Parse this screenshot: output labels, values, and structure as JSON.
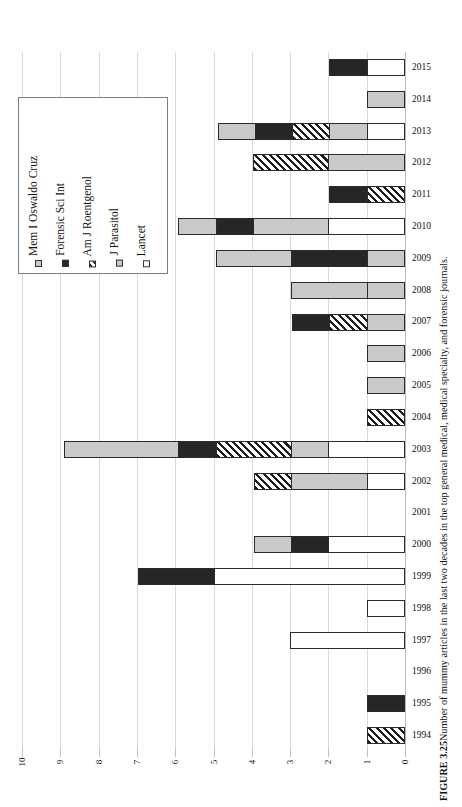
{
  "figure": {
    "caption_label": "FIGURE 3.25",
    "caption_text": "Number of mummy articles in the last two decades in the top general medical, medical specialty, and forensic journals."
  },
  "legend": {
    "items": [
      {
        "label": "Mem I Oswaldo Cruz",
        "key": "mem",
        "swatch": "light-gray-square",
        "color": "#c9c9c9"
      },
      {
        "label": "Forensic Sci Int",
        "key": "forensic",
        "swatch": "black-square",
        "color": "#262626"
      },
      {
        "label": "Am J Roentgenol",
        "key": "amjr",
        "swatch": "hatched-square",
        "color": "#1d1d1d"
      },
      {
        "label": "J Parasitol",
        "key": "jparasitol",
        "swatch": "light-gray-square",
        "color": "#c9c9c9"
      },
      {
        "label": "Lancet",
        "key": "lancet",
        "swatch": "white-square",
        "color": "#ffffff"
      }
    ]
  },
  "axis": {
    "x_ticks": [
      "10",
      "9",
      "8",
      "7",
      "6",
      "5",
      "4",
      "3",
      "2",
      "1",
      "0"
    ],
    "x_min": 0,
    "x_max": 10,
    "x_reversed": true
  },
  "chart_data": {
    "type": "bar",
    "orientation": "horizontal",
    "stacked": true,
    "title": "Number of mummy articles in the last two decades in the top general medical, medical specialty, and forensic journals.",
    "xlabel": "",
    "ylabel": "",
    "xlim": [
      10,
      0
    ],
    "grid": true,
    "legend_position": "left-inside",
    "categories": [
      "2015",
      "2014",
      "2013",
      "2012",
      "2011",
      "2010",
      "2009",
      "2008",
      "2007",
      "2006",
      "2005",
      "2004",
      "2003",
      "2002",
      "2001",
      "2000",
      "1999",
      "1998",
      "1997",
      "1996",
      "1995",
      "1994"
    ],
    "series": [
      {
        "name": "Mem I Oswaldo Cruz",
        "key": "mem",
        "values": [
          0,
          1,
          1,
          0,
          0,
          1,
          2,
          2,
          0,
          0,
          0,
          0,
          3,
          0,
          0,
          1,
          0,
          0,
          0,
          0,
          0,
          0
        ]
      },
      {
        "name": "Forensic Sci Int",
        "key": "forensic",
        "values": [
          1,
          0,
          1,
          0,
          1,
          1,
          2,
          0,
          1,
          0,
          0,
          0,
          1,
          0,
          0,
          1,
          2,
          0,
          0,
          0,
          1,
          0
        ]
      },
      {
        "name": "Am J Roentgenol",
        "key": "amjr",
        "values": [
          0,
          0,
          1,
          2,
          1,
          0,
          0,
          0,
          1,
          0,
          0,
          1,
          2,
          1,
          0,
          0,
          0,
          0,
          0,
          0,
          0,
          1
        ]
      },
      {
        "name": "J Parasitol",
        "key": "jparasitol",
        "values": [
          0,
          0,
          1,
          2,
          0,
          2,
          1,
          1,
          1,
          1,
          1,
          0,
          1,
          2,
          0,
          0,
          0,
          0,
          0,
          0,
          0,
          0
        ]
      },
      {
        "name": "Lancet",
        "key": "lancet",
        "values": [
          1,
          0,
          1,
          0,
          0,
          2,
          0,
          0,
          0,
          0,
          0,
          0,
          2,
          1,
          0,
          2,
          5,
          1,
          3,
          0,
          0,
          0
        ]
      }
    ],
    "totals": [
      2,
      1,
      5,
      4,
      2,
      6,
      5,
      3,
      3,
      1,
      1,
      1,
      9,
      4,
      0,
      4,
      7,
      1,
      3,
      0,
      1,
      1
    ]
  }
}
